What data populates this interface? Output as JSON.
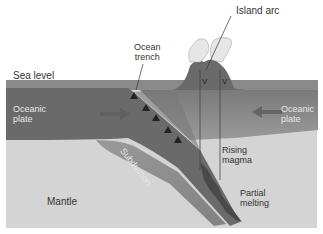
{
  "diagram": {
    "colors": {
      "sea": "#8a8a8a",
      "plate": "#6a6a6a",
      "mantle": "#d4d4d4",
      "subducting_slab": "#5a5a5a",
      "magma": "#4a4a4a",
      "cloud": "#e6e6e6",
      "label_dark": "#333333",
      "label_light": "#e8e8e8"
    },
    "labels": {
      "island_arc": "Island arc",
      "ocean_trench_line1": "Ocean",
      "ocean_trench_line2": "trench",
      "sea_level": "Sea level",
      "oceanic_plate_left_line1": "Oceanic",
      "oceanic_plate_left_line2": "plate",
      "oceanic_plate_right_line1": "Oceanic",
      "oceanic_plate_right_line2": "plate",
      "subduction": "Subduction",
      "rising_magma_line1": "Rising",
      "rising_magma_line2": "magma",
      "partial_melting_line1": "Partial",
      "partial_melting_line2": "melting",
      "mantle": "Mantle"
    },
    "volcano_vent_glyphs": [
      "V",
      "V"
    ],
    "trench_triangles": 5
  }
}
